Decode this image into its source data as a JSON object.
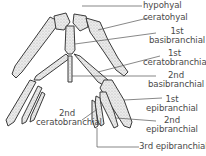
{
  "diagram": {
    "colors": {
      "bone_fill": "#e6e6e6",
      "bone_stroke": "#3a3a3a",
      "leader": "#555555",
      "text": "#4a4a4a"
    },
    "labels": [
      {
        "id": "hypohyal",
        "lines": [
          "hypohyal"
        ]
      },
      {
        "id": "ceratohyal",
        "lines": [
          "ceratohyal"
        ]
      },
      {
        "id": "1st-basibranchial",
        "lines": [
          "1st",
          "basibranchial"
        ]
      },
      {
        "id": "1st-ceratobranchial",
        "lines": [
          "1st",
          "ceratobranchial"
        ]
      },
      {
        "id": "2nd-basibranchial",
        "lines": [
          "2nd",
          "basibranchial"
        ]
      },
      {
        "id": "1st-epibranchial",
        "lines": [
          "1st",
          "epibranchial"
        ]
      },
      {
        "id": "2nd-epibranchial",
        "lines": [
          "2nd",
          "epibranchial"
        ]
      },
      {
        "id": "3rd-epibranchial",
        "lines": [
          "3rd epibranchial"
        ]
      },
      {
        "id": "2nd-ceratobranchial",
        "lines": [
          "2nd",
          "ceratobranchial"
        ]
      }
    ]
  }
}
